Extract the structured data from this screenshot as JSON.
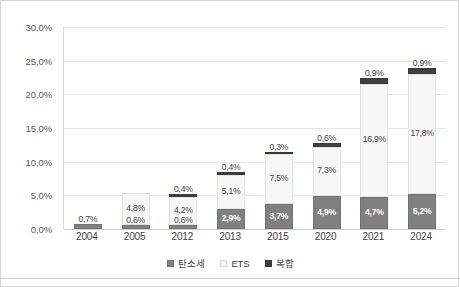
{
  "chart_data": {
    "type": "bar",
    "stacked": true,
    "title": "",
    "subtitle": "",
    "xlabel": "",
    "ylabel": "",
    "ylim": [
      0,
      30
    ],
    "ytick_values": [
      0,
      5,
      10,
      15,
      20,
      25,
      30
    ],
    "ytick_labels": [
      "0,0%",
      "5,0%",
      "10,0%",
      "15,0%",
      "20,0%",
      "25,0%",
      "30,0%"
    ],
    "grid": true,
    "legend_position": "bottom",
    "categories": [
      "2004",
      "2005",
      "2012",
      "2013",
      "2015",
      "2020",
      "2021",
      "2024"
    ],
    "series": [
      {
        "name": "탄소세",
        "color": "#808080",
        "values": [
          0.7,
          0.6,
          0.6,
          2.9,
          3.7,
          4.9,
          4.7,
          5.2
        ],
        "labels": [
          "0,7%",
          "0,6%",
          "0,6%",
          "2,9%",
          "3,7%",
          "4,9%",
          "4,7%",
          "5,2%"
        ]
      },
      {
        "name": "ETS",
        "color": "#f7f7f7",
        "values": [
          0.0,
          4.8,
          4.2,
          5.1,
          7.5,
          7.3,
          16.9,
          17.8
        ],
        "labels": [
          "",
          "4,8%",
          "4,2%",
          "5,1%",
          "7,5%",
          "7,3%",
          "16,9%",
          "17,8%"
        ]
      },
      {
        "name": "복합",
        "color": "#404040",
        "values": [
          0.0,
          0.0,
          0.4,
          0.4,
          0.3,
          0.6,
          0.9,
          0.9
        ],
        "labels": [
          "",
          "",
          "0,4%",
          "0,4%",
          "0,3%",
          "0,6%",
          "0,9%",
          "0,9%"
        ]
      }
    ]
  },
  "legend": {
    "items": [
      {
        "label": "탄소세",
        "swatch": "tax-swatch-icon"
      },
      {
        "label": "ETS",
        "swatch": "ets-swatch-icon"
      },
      {
        "label": "복합",
        "swatch": "mix-swatch-icon"
      }
    ]
  },
  "colors": {
    "carbon_tax": "#808080",
    "ets": "#f7f7f7",
    "combined": "#404040",
    "gridline": "#e6e6e6",
    "border": "#d6d6d6",
    "text": "#404040"
  }
}
